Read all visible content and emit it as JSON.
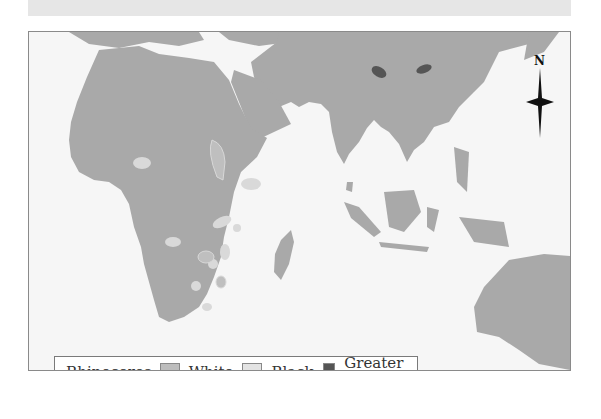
{
  "map": {
    "title": "Rhinoceros distribution (Africa & South Asia)",
    "colors": {
      "ocean": "#f6f6f6",
      "land": "#a9a9a9",
      "white_rhino": "#bdbdbd",
      "black_rhino": "#d9d9d9",
      "greater_indian_rhino": "#555555"
    },
    "compass": {
      "label": "N",
      "icon": "north-arrow-icon"
    }
  },
  "legend": {
    "title": "Rhinoceros",
    "items": [
      {
        "label": "White",
        "color": "#bdbdbd"
      },
      {
        "label": "Black",
        "color": "#e3e3e3"
      },
      {
        "label": "Greater Indian",
        "color": "#555555"
      }
    ]
  }
}
